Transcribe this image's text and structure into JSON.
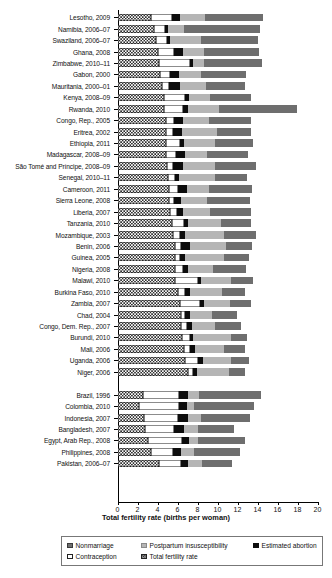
{
  "chart_data": {
    "type": "bar",
    "orientation": "horizontal",
    "stacked": true,
    "title": "",
    "xlabel": "Total fertility rate (births per woman)",
    "ylabel": "",
    "xlim": [
      0,
      20
    ],
    "xticks": [
      0,
      2,
      4,
      6,
      8,
      10,
      12,
      14,
      16,
      18,
      20
    ],
    "xticklabels": [
      "0",
      "2",
      "4",
      "6",
      "8",
      "10",
      "12",
      "14",
      "16",
      "18",
      "20"
    ],
    "grid": false,
    "legend_position": "bottom",
    "legend": [
      {
        "label": "Nonmarriage",
        "swatch": "nonmarriage",
        "color": "#6e6e6e"
      },
      {
        "label": "Postpartum insusceptibility",
        "swatch": "postpartum",
        "color": "#b5b5b5"
      },
      {
        "label": "Estimated abortion",
        "swatch": "abortion",
        "color": "#0d0d0d"
      },
      {
        "label": "Contraception",
        "swatch": "contraception",
        "color": "#ffffff"
      },
      {
        "label": "Total fertility rate",
        "swatch": "tfr",
        "color": "#ffffff"
      }
    ],
    "series_order": [
      "Total fertility rate",
      "Contraception",
      "Estimated abortion",
      "Postpartum insusceptibility",
      "Nonmarriage"
    ],
    "categories": [
      "Lesotho, 2009",
      "Namibia, 2006–07",
      "Swaziland, 2006–07",
      "Ghana, 2008",
      "Zimbabwe, 2010–11",
      "Gabon, 2000",
      "Mauritania, 2000–01",
      "Kenya, 2008–09",
      "Rwanda, 2010",
      "Congo, Rep., 2005",
      "Eritrea, 2002",
      "Ethiopia, 2011",
      "Madagascar, 2008–09",
      "São Tomé and Príncipe, 2008–09",
      "Senegal, 2010–11",
      "Cameroon, 2011",
      "Sierra Leone, 2008",
      "Liberia, 2007",
      "Tanzania, 2010",
      "Mozambique, 2003",
      "Benin, 2006",
      "Guinea, 2005",
      "Nigeria, 2008",
      "Malawi, 2010",
      "Burkina Faso, 2010",
      "Zambia, 2007",
      "Chad, 2004",
      "Congo, Dem. Rep., 2007",
      "Burundi, 2010",
      "Mali, 2006",
      "Uganda, 2006",
      "Niger, 2006",
      "",
      "Brazil, 1996",
      "Colombia, 2010",
      "Indonesia, 2007",
      "Bangladesh, 2007",
      "Egypt, Arab Rep., 2008",
      "Philippines, 2008",
      "Pakistan, 2006–07"
    ],
    "series": [
      {
        "name": "Total fertility rate",
        "values": [
          3.3,
          3.6,
          3.8,
          4.0,
          4.1,
          4.2,
          4.4,
          4.6,
          4.6,
          4.8,
          4.8,
          4.8,
          4.8,
          4.9,
          5.0,
          5.1,
          5.1,
          5.2,
          5.4,
          5.5,
          5.7,
          5.7,
          5.7,
          5.7,
          6.0,
          6.2,
          6.3,
          6.3,
          6.4,
          6.6,
          6.7,
          7.0,
          null,
          2.5,
          2.1,
          2.6,
          2.7,
          3.0,
          3.3,
          4.1
        ]
      },
      {
        "name": "Contraception",
        "values": [
          2.1,
          1.1,
          1.1,
          1.6,
          3.1,
          1.0,
          0.7,
          2.1,
          1.9,
          0.8,
          0.7,
          1.4,
          1.0,
          0.6,
          0.7,
          0.9,
          0.5,
          0.7,
          1.2,
          0.7,
          0.6,
          0.5,
          0.8,
          2.3,
          0.7,
          2.0,
          0.4,
          0.6,
          0.8,
          0.6,
          1.3,
          0.5,
          null,
          3.6,
          4.0,
          3.4,
          2.9,
          3.4,
          2.2,
          2.2
        ]
      },
      {
        "name": "Estimated abortion",
        "values": [
          0.8,
          0.3,
          0.3,
          0.9,
          0.3,
          0.9,
          1.1,
          0.4,
          0.5,
          0.9,
          0.9,
          0.4,
          0.9,
          1.0,
          0.4,
          0.9,
          0.7,
          0.6,
          0.4,
          0.5,
          0.9,
          0.5,
          0.5,
          0.3,
          0.5,
          0.4,
          0.5,
          0.5,
          0.3,
          0.5,
          0.5,
          0.4,
          null,
          0.9,
          0.8,
          1.0,
          1.0,
          0.7,
          0.8,
          0.7
        ]
      },
      {
        "name": "Postpartum insusceptibility",
        "values": [
          2.5,
          1.6,
          3.1,
          2.1,
          1.1,
          2.2,
          2.6,
          2.1,
          3.1,
          2.6,
          3.5,
          3.1,
          2.2,
          3.2,
          3.6,
          2.2,
          2.6,
          2.7,
          3.3,
          3.9,
          3.6,
          3.9,
          2.5,
          3.0,
          3.2,
          2.6,
          2.2,
          2.3,
          3.8,
          2.9,
          2.8,
          3.2,
          null,
          1.1,
          0.7,
          1.3,
          1.4,
          0.9,
          1.3,
          1.4
        ]
      },
      {
        "name": "Nonmarriage",
        "values": [
          5.8,
          7.6,
          5.7,
          5.5,
          5.8,
          4.5,
          3.9,
          4.1,
          7.8,
          4.2,
          3.4,
          3.8,
          4.1,
          4.1,
          3.2,
          4.3,
          4.3,
          4.1,
          3.0,
          3.2,
          2.6,
          2.5,
          3.3,
          2.2,
          2.3,
          2.1,
          2.5,
          2.6,
          1.6,
          2.1,
          1.8,
          1.6,
          null,
          6.2,
          6.0,
          4.9,
          3.6,
          4.7,
          4.6,
          3.0
        ]
      }
    ]
  }
}
